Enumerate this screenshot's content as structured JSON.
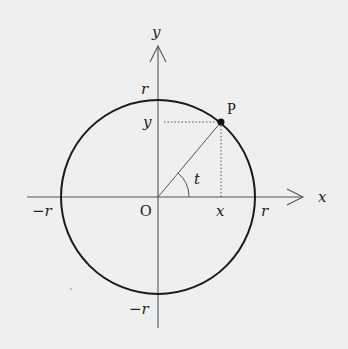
{
  "diagram": {
    "type": "unit-circle-trig",
    "axes": {
      "x_label": "x",
      "y_label": "y"
    },
    "origin_label": "O",
    "point_label": "P",
    "angle_label": "t",
    "radius_labels": {
      "top": "r",
      "right": "r",
      "left": "−r",
      "bottom": "−r"
    },
    "projection_labels": {
      "x": "x",
      "y": "y"
    },
    "colors": {
      "background": "#efefef",
      "stroke": "#222222",
      "axis": "#555555"
    }
  }
}
